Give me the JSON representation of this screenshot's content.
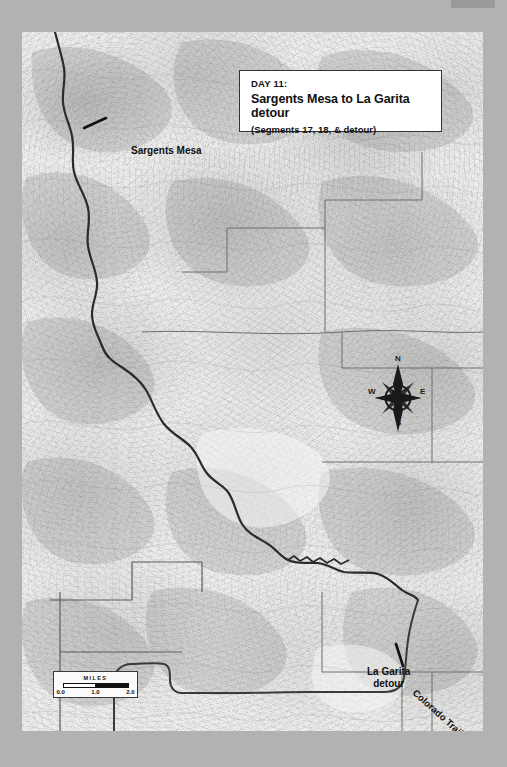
{
  "page": {
    "background_color": "#b2b2b2",
    "page_tab_label": ""
  },
  "map": {
    "plate_background_color": "#ececeb",
    "trail_color": "#2b2b2b",
    "boundary_color": "#6d6d6d",
    "title_card": {
      "day_label": "DAY 11:",
      "route_title": "Sargents Mesa to La Garita detour",
      "segments_note": "(Segments 17, 18, & detour)"
    },
    "scale_bar": {
      "title": "MILES",
      "ticks": [
        "0.0",
        "1.0",
        "2.0"
      ],
      "units": "miles",
      "max_value": 2.0
    },
    "compass": {
      "north": "N",
      "east": "E",
      "south": "S",
      "west": "W"
    },
    "labels": [
      {
        "name": "sargents-mesa",
        "text": "Sargents Mesa"
      },
      {
        "name": "la-garita-detour",
        "line1": "La Garita",
        "line2": "detour"
      },
      {
        "name": "colorado-trail",
        "text": "Colorado Trail"
      }
    ]
  }
}
